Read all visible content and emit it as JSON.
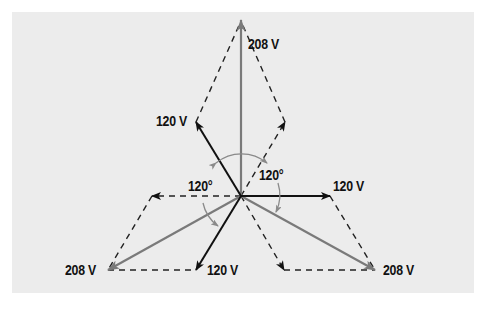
{
  "diagram": {
    "colors": {
      "background": "#ececec",
      "phase_vector": "#111111",
      "line_vector": "#7a7a7a",
      "construction_line": "#222222",
      "angle_arc": "#8a8a8a"
    },
    "labels": {
      "top_line_voltage": "208 V",
      "upper_left_phase_voltage": "120 V",
      "right_phase_voltage": "120 V",
      "bottom_phase_voltage": "120 V",
      "bottom_left_line_voltage": "208 V",
      "bottom_right_line_voltage": "208 V",
      "angle_left": "120°",
      "angle_right": "120°"
    },
    "vectors": [
      {
        "name": "phase-a",
        "type": "phase",
        "magnitude": "120 V",
        "direction": "upper-left"
      },
      {
        "name": "phase-b",
        "type": "phase",
        "magnitude": "120 V",
        "direction": "right"
      },
      {
        "name": "phase-c",
        "type": "phase",
        "magnitude": "120 V",
        "direction": "down-left"
      },
      {
        "name": "line-top",
        "type": "line",
        "magnitude": "208 V",
        "direction": "up"
      },
      {
        "name": "line-bottom-left",
        "type": "line",
        "magnitude": "208 V",
        "direction": "down-left"
      },
      {
        "name": "line-bottom-right",
        "type": "line",
        "magnitude": "208 V",
        "direction": "down-right"
      }
    ],
    "angles": [
      "120°",
      "120°"
    ]
  }
}
